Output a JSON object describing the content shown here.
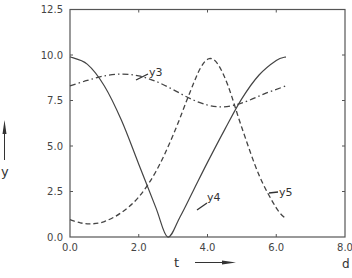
{
  "chart_data": {
    "type": "line",
    "title": "",
    "xlabel": "t",
    "ylabel": "y",
    "x_unit": "d",
    "xlim": [
      0.0,
      8.0
    ],
    "ylim": [
      0.0,
      12.5
    ],
    "grid": false,
    "legend_position": "inline labels",
    "x_ticks": [
      "0.0",
      "2.0",
      "4.0",
      "6.0",
      "8.0"
    ],
    "y_ticks": [
      "0.0",
      "2.5",
      "5.0",
      "7.5",
      "10.0",
      "12.5"
    ],
    "series": [
      {
        "name": "y3",
        "style": "dash-dot",
        "x": [
          0.0,
          0.5,
          1.0,
          1.5,
          2.0,
          2.5,
          3.0,
          3.5,
          4.0,
          4.4,
          4.8,
          5.2,
          5.7,
          6.28
        ],
        "values": [
          8.3,
          8.6,
          8.85,
          8.95,
          8.85,
          8.55,
          8.1,
          7.6,
          7.25,
          7.15,
          7.25,
          7.5,
          7.9,
          8.3
        ]
      },
      {
        "name": "y4",
        "style": "solid",
        "x": [
          0.0,
          0.5,
          1.0,
          1.5,
          2.0,
          2.5,
          2.84,
          3.2,
          3.6,
          4.0,
          4.5,
          5.0,
          5.5,
          6.0,
          6.28
        ],
        "values": [
          9.9,
          9.5,
          8.3,
          6.4,
          4.0,
          1.6,
          0.0,
          1.1,
          2.6,
          4.1,
          5.9,
          7.6,
          8.9,
          9.7,
          9.9
        ]
      },
      {
        "name": "y5",
        "style": "dashed",
        "x": [
          0.0,
          0.3,
          0.6,
          1.0,
          1.5,
          2.0,
          2.5,
          3.0,
          3.5,
          3.8,
          4.05,
          4.3,
          4.6,
          5.0,
          5.5,
          6.0,
          6.28
        ],
        "values": [
          0.95,
          0.78,
          0.72,
          0.85,
          1.35,
          2.2,
          3.6,
          5.6,
          8.0,
          9.3,
          9.8,
          9.5,
          8.3,
          6.0,
          3.4,
          1.6,
          1.0
        ]
      }
    ]
  },
  "labels": {
    "x_axis": "t",
    "y_axis": "y",
    "unit": "d",
    "y3": "y3",
    "y4": "y4",
    "y5": "y5"
  },
  "ticks": {
    "x": [
      "0.0",
      "2.0",
      "4.0",
      "6.0",
      "8.0"
    ],
    "y": [
      "0.0",
      "2.5",
      "5.0",
      "7.5",
      "10.0",
      "12.5"
    ]
  }
}
